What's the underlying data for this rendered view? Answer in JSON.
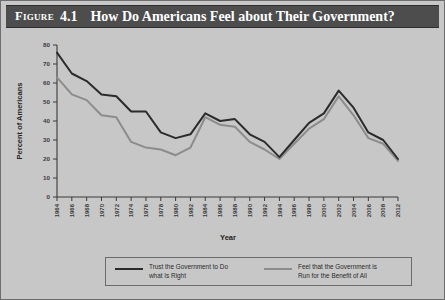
{
  "figure": {
    "label": "Figure",
    "number": "4.1",
    "title": "How Do Americans Feel about Their Government?"
  },
  "colors": {
    "background": "#c7c7c7",
    "title_bar": "#4d4d4d",
    "title_text": "#ffffff",
    "axis": "#3a3a3a",
    "series_trust": "#2b2b2b",
    "series_benefit": "#8c8c8c",
    "legend_border": "#6b6b6b"
  },
  "axes": {
    "x_title": "Year",
    "y_title": "Percent of Americans",
    "y_ticks": [
      "0",
      "10",
      "20",
      "30",
      "40",
      "50",
      "60",
      "70",
      "80"
    ],
    "x_ticks": [
      "1964",
      "1966",
      "1968",
      "1970",
      "1972",
      "1974",
      "1976",
      "1978",
      "1980",
      "1982",
      "1984",
      "1986",
      "1988",
      "1990",
      "1992",
      "1994",
      "1996",
      "1998",
      "2000",
      "2002",
      "2004",
      "2006",
      "2008",
      "2012"
    ]
  },
  "legend": {
    "entries": [
      {
        "label": "Trust the Government to Do\nwhat Is Right",
        "color": "#2b2b2b",
        "swatch": "line-swatch-dark"
      },
      {
        "label": "Feel that the Government is\nRun for the Benefit of All",
        "color": "#8c8c8c",
        "swatch": "line-swatch-light"
      }
    ]
  },
  "chart_data": {
    "type": "line",
    "title": "How Do Americans Feel about Their Government?",
    "xlabel": "Year",
    "ylabel": "Percent of Americans",
    "xlim": [
      1964,
      2012
    ],
    "ylim": [
      0,
      80
    ],
    "y_ticks": [
      0,
      10,
      20,
      30,
      40,
      50,
      60,
      70,
      80
    ],
    "grid": false,
    "legend_position": "bottom",
    "x": [
      1964,
      1966,
      1968,
      1970,
      1972,
      1974,
      1976,
      1978,
      1980,
      1982,
      1984,
      1986,
      1988,
      1990,
      1992,
      1994,
      1996,
      1998,
      2000,
      2002,
      2004,
      2006,
      2008,
      2012
    ],
    "series": [
      {
        "name": "Trust the Government to Do what Is Right",
        "color": "#2b2b2b",
        "values": [
          76,
          65,
          61,
          54,
          53,
          45,
          45,
          34,
          31,
          33,
          44,
          40,
          41,
          33,
          29,
          21,
          30,
          39,
          44,
          56,
          47,
          34,
          30,
          20
        ]
      },
      {
        "name": "Feel that the Government is Run for the Benefit of All",
        "color": "#8c8c8c",
        "values": [
          63,
          54,
          51,
          43,
          42,
          29,
          26,
          25,
          22,
          26,
          42,
          38,
          37,
          29,
          25,
          20,
          28,
          36,
          41,
          53,
          43,
          31,
          28,
          19
        ]
      }
    ]
  }
}
